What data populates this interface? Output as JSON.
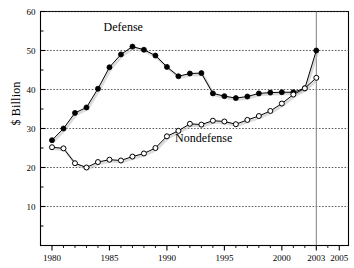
{
  "chart_data": {
    "type": "line",
    "title": "",
    "xlabel": "",
    "ylabel": "$ Billion",
    "xlim": [
      1979.0,
      2005.8
    ],
    "ylim": [
      0,
      60
    ],
    "grid": true,
    "grid_axis": "y",
    "legend_position": "inline-annotation",
    "x_ticks": [
      1980,
      1985,
      1990,
      1995,
      2000,
      2003,
      2005
    ],
    "x_tick_labels": [
      "1980",
      "1985",
      "1990",
      "1995",
      "2000",
      "2003",
      "2005"
    ],
    "x_minor_ticks": [
      1981,
      1982,
      1983,
      1984,
      1986,
      1987,
      1988,
      1989,
      1991,
      1992,
      1993,
      1994,
      1996,
      1997,
      1998,
      1999,
      2001,
      2002,
      2004
    ],
    "y_ticks": [
      10,
      20,
      30,
      40,
      50,
      60
    ],
    "y_tick_labels": [
      "10",
      "20",
      "30",
      "40",
      "50",
      "60"
    ],
    "y_minor_ticks": [
      5,
      15,
      25,
      35,
      45,
      55
    ],
    "reference_line_x": 2003,
    "x": [
      1980,
      1981,
      1982,
      1983,
      1984,
      1985,
      1986,
      1987,
      1988,
      1989,
      1990,
      1991,
      1992,
      1993,
      1994,
      1995,
      1996,
      1997,
      1998,
      1999,
      2000,
      2001,
      2002,
      2003
    ],
    "series": [
      {
        "name": "Defense",
        "marker": "filled-circle",
        "color": "#000000",
        "label_x": 1986.2,
        "label_y": 55.0,
        "values": [
          27.0,
          30.0,
          34.0,
          35.4,
          40.2,
          45.7,
          49.0,
          51.0,
          50.2,
          48.7,
          45.8,
          43.4,
          44.1,
          44.2,
          39.0,
          38.3,
          37.8,
          38.2,
          39.0,
          39.2,
          39.3,
          39.3,
          40.3,
          50.0
        ]
      },
      {
        "name": "Nondefense",
        "marker": "open-circle",
        "color": "#000000",
        "label_x": 1993.2,
        "label_y": 26.5,
        "values": [
          25.2,
          24.9,
          21.1,
          20.0,
          21.4,
          22.0,
          21.8,
          22.8,
          23.6,
          25.0,
          28.0,
          29.4,
          31.2,
          31.0,
          32.0,
          31.8,
          31.1,
          32.2,
          33.2,
          34.5,
          36.4,
          38.7,
          40.3,
          43.0
        ]
      }
    ]
  },
  "annotations": {
    "defense_label": "Defense",
    "nondefense_label": "Nondefense"
  }
}
